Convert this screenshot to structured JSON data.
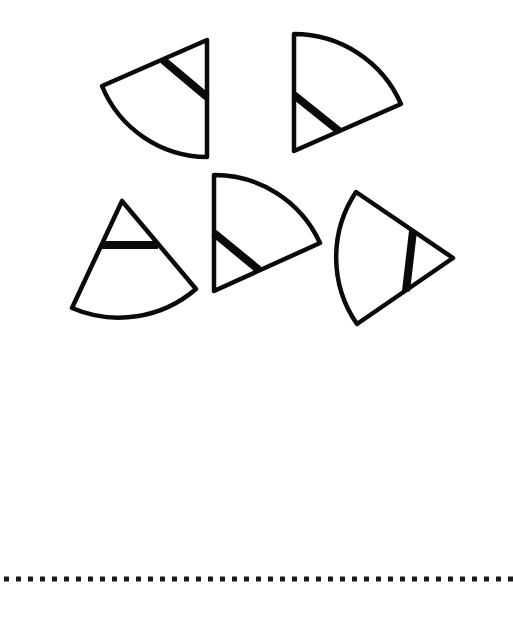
{
  "page": {
    "background": "#ffffff",
    "ink_color": "#0a0a0a",
    "text": []
  },
  "shapes": [
    {
      "id": "sector-1",
      "description": "circular sector, apex at right edge pointing up-right, arc on lower-left, thick band near apex",
      "apex": [
        207,
        40
      ],
      "radius_end_a": [
        102,
        86
      ],
      "radius_end_b": [
        207,
        157
      ],
      "band": [
        [
          163,
          60
        ],
        [
          207,
          97
        ]
      ]
    },
    {
      "id": "sector-2",
      "description": "circular sector, apex at bottom-left, arc on upper-right, thick band near apex",
      "apex": [
        294,
        151
      ],
      "radius_end_a": [
        294,
        34
      ],
      "radius_end_b": [
        401,
        104
      ],
      "band": [
        [
          294,
          95
        ],
        [
          339,
          131
        ]
      ]
    },
    {
      "id": "sector-3",
      "description": "circular sector, apex pointing up, arc at bottom, horizontal thick band near apex",
      "apex": [
        122,
        201
      ],
      "radius_end_a": [
        72,
        308
      ],
      "radius_end_b": [
        196,
        289
      ],
      "band": [
        [
          101,
          245
        ],
        [
          158,
          245
        ]
      ]
    },
    {
      "id": "sector-4",
      "description": "circular sector, apex at bottom-left, arc on upper-right, thick band near apex",
      "apex": [
        214,
        291
      ],
      "radius_end_a": [
        214,
        175
      ],
      "radius_end_b": [
        320,
        243
      ],
      "band": [
        [
          214,
          233
        ],
        [
          259,
          270
        ]
      ]
    },
    {
      "id": "sector-5",
      "description": "circular sector, apex pointing right, arc on left, near-vertical thick band near apex",
      "apex": [
        453,
        258
      ],
      "radius_end_a": [
        356,
        192
      ],
      "radius_end_b": [
        357,
        324
      ],
      "band": [
        [
          413,
          231
        ],
        [
          406,
          291
        ]
      ]
    }
  ],
  "divider": {
    "type": "dotted-line",
    "y": 579,
    "x_start": 4,
    "x_end": 513,
    "dot_size": 5,
    "dot_spacing": 12,
    "count": 43
  }
}
